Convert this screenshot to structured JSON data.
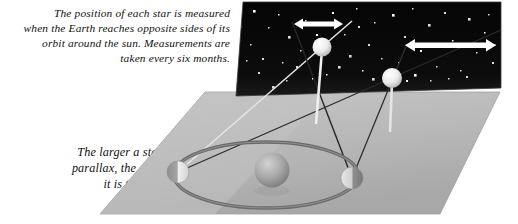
{
  "figure": {
    "topic": "stellar-parallax",
    "captions": {
      "top": "The position of each star is measured\nwhen the Earth reaches opposite sides of its\norbit around the sun. Measurements are\ntaken every six months.",
      "bottom": "The larger a star's\nparallax, the closer\nit is to Earth."
    },
    "colors": {
      "page_background": "#ffffff",
      "sky_panel": "#0a0a0a",
      "sky_panel_edge": "#2b2b2b",
      "star_dot": "#ffffff",
      "ground_plane": "#b4b4b4",
      "ground_plane_light": "#c8c8c8",
      "ground_plane_shadow": "#9a9a9a",
      "orbit_ring": "#6e6e6e",
      "sun_body": "#a9a9a9",
      "earth_body": "#d9d9d9",
      "star_body": "#f0f0f0",
      "sightline_light": "#e8e8e8",
      "sightline_dark": "#2a2a2a",
      "arrow": "#ffffff",
      "text": "#111111"
    },
    "sky_panel": {
      "label": "night-sky-backdrop",
      "top_left": [
        243,
        2
      ],
      "top_right": [
        501,
        2
      ],
      "bottom_right": [
        501,
        88
      ],
      "bottom_left": [
        236,
        96
      ]
    },
    "ground_plane": {
      "label": "orbital-plane",
      "top_left": [
        205,
        92
      ],
      "top_right": [
        500,
        92
      ],
      "bottom_right": [
        440,
        214
      ],
      "bottom_left": [
        100,
        214
      ]
    },
    "bodies": [
      {
        "name": "sun",
        "cx": 272,
        "cy": 170,
        "r": 17.5,
        "shading": "sphere"
      },
      {
        "name": "earth-position-a",
        "cx": 178,
        "cy": 172,
        "r": 11,
        "shading": "half-lit-left"
      },
      {
        "name": "earth-position-b",
        "cx": 352,
        "cy": 178,
        "r": 11,
        "shading": "half-lit-right"
      },
      {
        "name": "near-star",
        "cx": 322,
        "cy": 47,
        "r": 9.5,
        "shading": "sphere-bright"
      },
      {
        "name": "far-star",
        "cx": 392,
        "cy": 78,
        "r": 10,
        "shading": "sphere-bright"
      }
    ],
    "orbit": {
      "cx": 266,
      "cy": 175,
      "rx": 92,
      "ry": 33
    },
    "parallax_arrows": [
      {
        "name": "near-star-parallax-arrow",
        "x1": 294,
        "y1": 24,
        "x2": 343,
        "y2": 24,
        "length_px": 49,
        "meaning": "large apparent shift"
      },
      {
        "name": "far-star-parallax-arrow",
        "x1": 406,
        "y1": 45,
        "x2": 495,
        "y2": 45,
        "length_px": 89,
        "meaning": "small apparent shift"
      }
    ],
    "sightlines": [
      {
        "name": "sightline-earth-a-to-near-star",
        "from": [
          178,
          172
        ],
        "to": [
          322,
          47
        ],
        "tone": "light",
        "extends_to": [
          352,
          21
        ]
      },
      {
        "name": "sightline-earth-b-to-near-star",
        "from": [
          352,
          178
        ],
        "to": [
          322,
          47
        ],
        "tone": "dark",
        "extends_to": [
          294,
          24
        ]
      },
      {
        "name": "sightline-earth-a-to-far-star",
        "from": [
          178,
          172
        ],
        "to": [
          392,
          78
        ],
        "tone": "dark",
        "extends_to": [
          500,
          32
        ]
      },
      {
        "name": "sightline-earth-b-to-far-star",
        "from": [
          352,
          178
        ],
        "to": [
          392,
          78
        ],
        "tone": "dark",
        "extends_to": [
          408,
          46
        ]
      }
    ],
    "drop_lines": [
      {
        "name": "near-star-drop-line",
        "x": 322,
        "y1": 56,
        "y2": 120
      },
      {
        "name": "far-star-drop-line",
        "x": 392,
        "y1": 88,
        "y2": 130
      }
    ],
    "starfield": [
      [
        253,
        10
      ],
      [
        268,
        27
      ],
      [
        250,
        44
      ],
      [
        262,
        58
      ],
      [
        278,
        14
      ],
      [
        288,
        36
      ],
      [
        296,
        66
      ],
      [
        305,
        20
      ],
      [
        312,
        78
      ],
      [
        258,
        72
      ],
      [
        272,
        86
      ],
      [
        286,
        80
      ],
      [
        332,
        12
      ],
      [
        344,
        34
      ],
      [
        356,
        8
      ],
      [
        349,
        55
      ],
      [
        362,
        70
      ],
      [
        374,
        22
      ],
      [
        368,
        44
      ],
      [
        381,
        58
      ],
      [
        392,
        14
      ],
      [
        404,
        36
      ],
      [
        398,
        62
      ],
      [
        412,
        8
      ],
      [
        420,
        50
      ],
      [
        428,
        24
      ],
      [
        436,
        66
      ],
      [
        444,
        12
      ],
      [
        452,
        40
      ],
      [
        460,
        70
      ],
      [
        468,
        18
      ],
      [
        476,
        52
      ],
      [
        484,
        32
      ],
      [
        492,
        62
      ],
      [
        246,
        60
      ],
      [
        338,
        66
      ],
      [
        316,
        34
      ],
      [
        300,
        50
      ],
      [
        282,
        62
      ],
      [
        358,
        26
      ],
      [
        414,
        74
      ],
      [
        430,
        80
      ],
      [
        466,
        76
      ],
      [
        488,
        14
      ],
      [
        326,
        74
      ],
      [
        372,
        78
      ],
      [
        448,
        78
      ],
      [
        240,
        26
      ],
      [
        406,
        80
      ],
      [
        494,
        44
      ]
    ]
  }
}
